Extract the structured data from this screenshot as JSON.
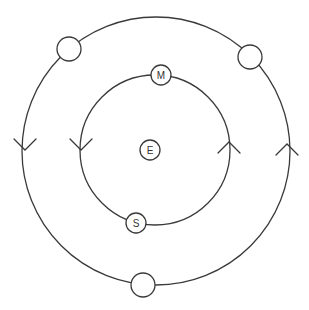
{
  "diagram": {
    "colors": {
      "stroke": "#3a3a3a",
      "background": "#ffffff",
      "text": "#333333"
    },
    "center_node": {
      "label": "E",
      "x": 150,
      "y": 150,
      "r": 10
    },
    "orbits": [
      {
        "name": "inner",
        "cx": 155,
        "cy": 150,
        "r": 75,
        "nodes": [
          {
            "label": "M",
            "x": 161,
            "y": 75,
            "r": 10
          },
          {
            "label": "S",
            "x": 136,
            "y": 223,
            "r": 10
          }
        ],
        "arrows": [
          {
            "x": 81,
            "y": 150,
            "direction": "down"
          },
          {
            "x": 229,
            "y": 142,
            "direction": "up"
          }
        ]
      },
      {
        "name": "outer",
        "cx": 156,
        "cy": 151,
        "r": 134,
        "nodes": [
          {
            "label": "",
            "x": 69,
            "y": 49,
            "r": 12
          },
          {
            "label": "",
            "x": 250,
            "y": 57,
            "r": 12
          },
          {
            "label": "",
            "x": 143,
            "y": 285,
            "r": 12
          }
        ],
        "arrows": [
          {
            "x": 25,
            "y": 150,
            "direction": "down"
          },
          {
            "x": 287,
            "y": 144,
            "direction": "up"
          }
        ]
      }
    ]
  }
}
